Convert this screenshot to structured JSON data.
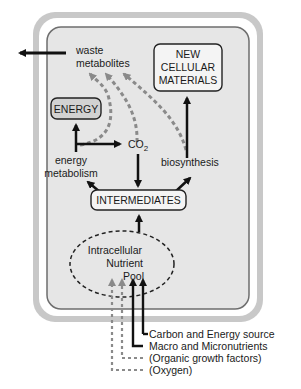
{
  "diagram": {
    "colors": {
      "outer_frame": "#c8c8c8",
      "cell_fill": "#e6e6e6",
      "cell_border": "#6e6e6e",
      "arrow_solid": "#111111",
      "arrow_dashed": "#8a8a8a",
      "box_fill": "#f4f4f4",
      "energy_fill": "#d2d2d2"
    },
    "nodes": {
      "waste": [
        "waste",
        "metabolites"
      ],
      "new_materials": [
        "NEW",
        "CELLULAR",
        "MATERIALS"
      ],
      "energy": "ENERGY",
      "energy_metabolism": [
        "energy",
        "metabolism"
      ],
      "co2": "CO",
      "co2_sub": "2",
      "biosynthesis": "biosynthesis",
      "intermediates": "INTERMEDIATES",
      "pool": [
        "Intracellular",
        "Nutrient",
        "Pool"
      ]
    },
    "inputs": [
      {
        "label": "Carbon and Energy source",
        "style": "solid"
      },
      {
        "label": "Macro and Micronutrients",
        "style": "solid"
      },
      {
        "label": "(Organic growth factors)",
        "style": "dashed"
      },
      {
        "label": "(Oxygen)",
        "style": "dashed"
      }
    ]
  }
}
